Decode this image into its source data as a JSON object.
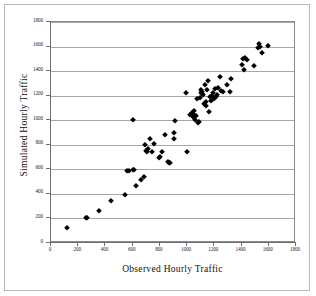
{
  "figure": {
    "background_color": "#ffffff",
    "frame_color": "#b9b9b9",
    "plot_border_color": "#8a8a8a",
    "gridline_color": "#a7a7a7",
    "marker_color": "#000000",
    "marker_shape": "diamond"
  },
  "chart_data": {
    "type": "scatter",
    "title": "",
    "xlabel": "Observed Hourly Traffic",
    "ylabel": "Simulated Hourly Traffic",
    "xlim": [
      0,
      1800
    ],
    "ylim": [
      0,
      1800
    ],
    "xticks": [
      0,
      200,
      400,
      600,
      800,
      1000,
      1200,
      1400,
      1600,
      1800
    ],
    "yticks": [
      0,
      200,
      400,
      600,
      800,
      1000,
      1200,
      1400,
      1600,
      1800
    ],
    "grid": "horizontal",
    "legend": null,
    "series": [
      {
        "name": "Observed vs Simulated",
        "points": [
          [
            120,
            125
          ],
          [
            258,
            200
          ],
          [
            268,
            202
          ],
          [
            352,
            260
          ],
          [
            440,
            340
          ],
          [
            540,
            388
          ],
          [
            560,
            585
          ],
          [
            572,
            588
          ],
          [
            600,
            592
          ],
          [
            608,
            596
          ],
          [
            600,
            1000
          ],
          [
            628,
            465
          ],
          [
            660,
            512
          ],
          [
            680,
            540
          ],
          [
            690,
            798
          ],
          [
            700,
            750
          ],
          [
            706,
            742
          ],
          [
            712,
            762
          ],
          [
            730,
            845
          ],
          [
            742,
            740
          ],
          [
            760,
            808
          ],
          [
            790,
            692
          ],
          [
            800,
            700
          ],
          [
            812,
            740
          ],
          [
            838,
            878
          ],
          [
            860,
            660
          ],
          [
            868,
            650
          ],
          [
            872,
            655
          ],
          [
            900,
            900
          ],
          [
            906,
            848
          ],
          [
            912,
            995
          ],
          [
            995,
            1218
          ],
          [
            1000,
            742
          ],
          [
            1020,
            1040
          ],
          [
            1035,
            1060
          ],
          [
            1040,
            1048
          ],
          [
            1045,
            1028
          ],
          [
            1052,
            1072
          ],
          [
            1060,
            1005
          ],
          [
            1068,
            1038
          ],
          [
            1075,
            1175
          ],
          [
            1080,
            975
          ],
          [
            1088,
            982
          ],
          [
            1092,
            1185
          ],
          [
            1100,
            1245
          ],
          [
            1105,
            1218
          ],
          [
            1108,
            1210
          ],
          [
            1112,
            1228
          ],
          [
            1118,
            1202
          ],
          [
            1125,
            1135
          ],
          [
            1130,
            1290
          ],
          [
            1138,
            1148
          ],
          [
            1140,
            1112
          ],
          [
            1148,
            1248
          ],
          [
            1152,
            1318
          ],
          [
            1158,
            1068
          ],
          [
            1165,
            1192
          ],
          [
            1172,
            1158
          ],
          [
            1180,
            1200
          ],
          [
            1188,
            1218
          ],
          [
            1195,
            1172
          ],
          [
            1205,
            1252
          ],
          [
            1212,
            1190
          ],
          [
            1218,
            1205
          ],
          [
            1230,
            1262
          ],
          [
            1240,
            1355
          ],
          [
            1248,
            1242
          ],
          [
            1265,
            1232
          ],
          [
            1290,
            1288
          ],
          [
            1318,
            1230
          ],
          [
            1325,
            1332
          ],
          [
            1400,
            1450
          ],
          [
            1412,
            1498
          ],
          [
            1418,
            1412
          ],
          [
            1425,
            1510
          ],
          [
            1438,
            1492
          ],
          [
            1490,
            1438
          ],
          [
            1518,
            1592
          ],
          [
            1525,
            1618
          ],
          [
            1535,
            1600
          ],
          [
            1548,
            1545
          ],
          [
            1592,
            1602
          ]
        ]
      }
    ]
  }
}
